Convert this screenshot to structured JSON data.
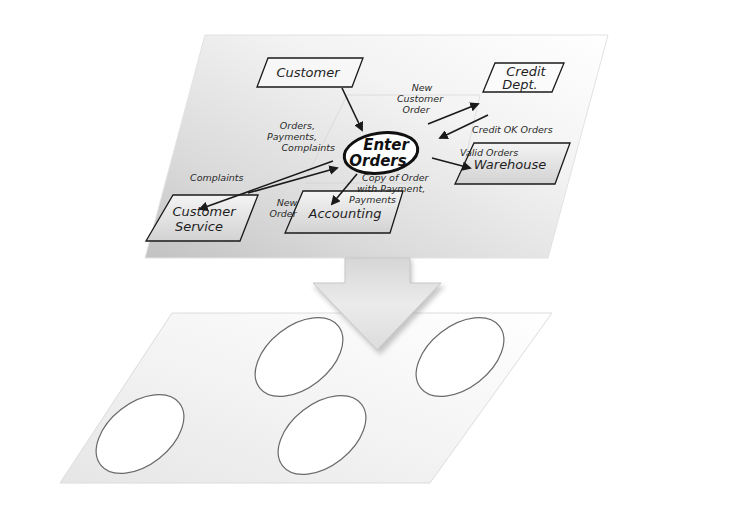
{
  "diagram": {
    "top_plane": {
      "description": "Data flow diagram drawn on a tilted plane",
      "process": {
        "id": "enter-orders",
        "label_lines": [
          "Enter",
          "Orders"
        ]
      },
      "entities": [
        {
          "id": "customer",
          "label_lines": [
            "Customer"
          ]
        },
        {
          "id": "credit-dept",
          "label_lines": [
            "Credit",
            "Dept."
          ]
        },
        {
          "id": "warehouse",
          "label_lines": [
            "Warehouse"
          ]
        },
        {
          "id": "customer-service",
          "label_lines": [
            "Customer",
            "Service"
          ]
        },
        {
          "id": "accounting",
          "label_lines": [
            "Accounting"
          ]
        }
      ],
      "flows": [
        {
          "id": "customer-to-process",
          "from": "customer",
          "to": "enter-orders",
          "label_lines": [
            "Orders,",
            "Payments,",
            "Complaints"
          ]
        },
        {
          "id": "process-to-credit",
          "from": "enter-orders",
          "to": "credit-dept",
          "label_lines": [
            "New",
            "Customer",
            "Order"
          ]
        },
        {
          "id": "credit-to-process",
          "from": "credit-dept",
          "to": "enter-orders",
          "label_lines": [
            "Credit OK Orders"
          ]
        },
        {
          "id": "process-to-warehouse",
          "from": "enter-orders",
          "to": "warehouse",
          "label_lines": [
            "Valid Orders"
          ]
        },
        {
          "id": "process-to-service",
          "from": "enter-orders",
          "to": "customer-service",
          "label_lines": [
            "Complaints"
          ]
        },
        {
          "id": "service-to-process",
          "from": "customer-service",
          "to": "enter-orders",
          "label_lines": [
            "New",
            "Order"
          ]
        },
        {
          "id": "process-to-accounting",
          "from": "enter-orders",
          "to": "accounting",
          "label_lines": [
            "Copy of Order",
            "with Payment,",
            "Payments"
          ]
        }
      ]
    },
    "transition_arrow": {
      "direction": "down"
    },
    "bottom_plane": {
      "description": "Empty tilted plane with four blank ellipses",
      "ellipse_count": 4
    },
    "colors": {
      "ink": "#1a1a1a",
      "plane_light": "#fafafa",
      "plane_dark": "#c4c4c4",
      "arrow_fill": "#e6e6e6",
      "arrow_shadow": "#b5b5b5",
      "ellipse_stroke": "#6a6a6a"
    }
  }
}
